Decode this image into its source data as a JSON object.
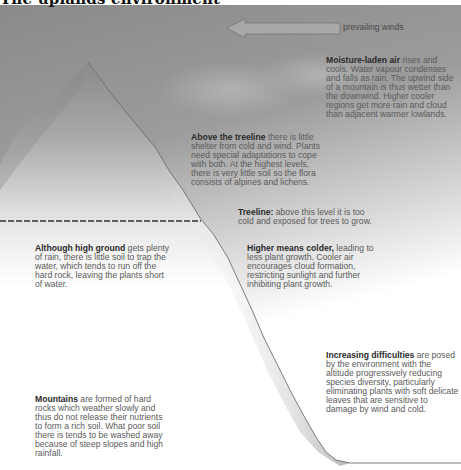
{
  "title": "The uplands environment",
  "wind": {
    "label": "prevailing winds",
    "direction": "left",
    "icon": "arrow-left-icon"
  },
  "colors": {
    "sky_top": "#8c8c8c",
    "sky_bottom": "#ffffff",
    "mountain_shadow": "#7a7a7a",
    "mountain_light": "#ffffff",
    "outline": "#6a6a6a",
    "treeline_dash": "#333333"
  },
  "annotations": {
    "moisture": {
      "heading": "Moisture-laden air",
      "body": " rises and cools. Water vapour condenses and falls as rain. The upwind side of a mountain is thus wetter than the downwind. Higher cooler regions get more rain and cloud than adjacent warmer lowlands."
    },
    "above_treeline": {
      "heading": "Above the treeline",
      "body": " there is little shelter from cold and wind. Plants need special adaptations to cope with both. At the highest levels, there is very little soil so the flora consists of alpines and lichens."
    },
    "treeline": {
      "heading": "Treeline:",
      "body": " above this level it is too cold and exposed for trees to grow."
    },
    "higher_colder": {
      "heading": "Higher means colder,",
      "body": " leading to less plant growth. Cooler air encourages cloud formation, restricting sunlight and further inhibiting plant growth."
    },
    "high_ground": {
      "heading": "Although high ground",
      "body": " gets plenty of rain, there is little soil to trap the water, which tends to run off the hard rock, leaving the plants short of water."
    },
    "difficulties": {
      "heading": "Increasing difficulties",
      "body": " are posed by the environment with the altitude progressively reducing species diversity, particularly eliminating plants with soft delicate leaves that are sensitive to damage by wind and cold."
    },
    "mountains": {
      "heading": "Mountains",
      "body": " are formed of hard rocks which weather slowly and thus do not release their nutrients to form a rich soil. What poor soil there is tends to be washed away because of steep slopes and high rainfall."
    }
  }
}
